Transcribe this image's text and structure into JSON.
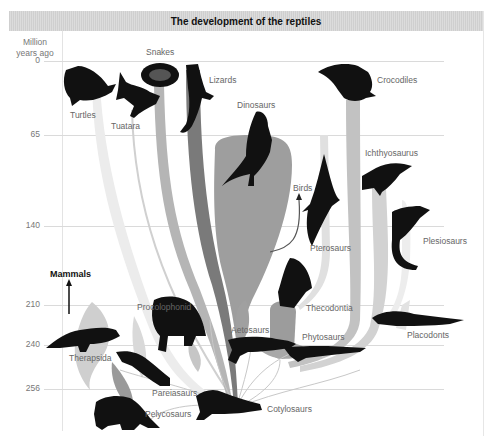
{
  "title": "The development of the reptiles",
  "axis": {
    "title_line1": "Million",
    "title_line2": "years ago",
    "ticks": [
      {
        "label": "0",
        "y": 61
      },
      {
        "label": "65",
        "y": 135
      },
      {
        "label": "140",
        "y": 226
      },
      {
        "label": "210",
        "y": 305
      },
      {
        "label": "240",
        "y": 345
      },
      {
        "label": "256",
        "y": 389
      }
    ]
  },
  "groups": {
    "snakes": "Snakes",
    "turtles": "Turtles",
    "tuatara": "Tuatara",
    "lizards": "Lizards",
    "dinosaurs": "Dinosaurs",
    "crocodiles": "Crocodiles",
    "ichthyosaurus": "Ichthyosaurus",
    "birds": "Birds",
    "pterosaurs": "Pterosaurs",
    "plesiosaurs": "Plesiosaurs",
    "thecodontia": "Thecodontia",
    "procolophonid": "Procolophonid",
    "aetosaurs": "Aetosaurs",
    "phytosaurs": "Phytosaurs",
    "placodonts": "Placodonts",
    "therapsida": "Therapsida",
    "pareiasaurs": "Pareiasaurs",
    "pelycosaurs": "Pelycosaurs",
    "cotylosaurs": "Cotylosaurs",
    "mammals": "Mammals"
  },
  "colors": {
    "title_bar": "#d5d5d5",
    "stream_light": "#e6e6e6",
    "stream_mid": "#b5b5b5",
    "stream_dark": "#7a7a7a",
    "silhouette": "#111111",
    "grid": "#dadada"
  }
}
